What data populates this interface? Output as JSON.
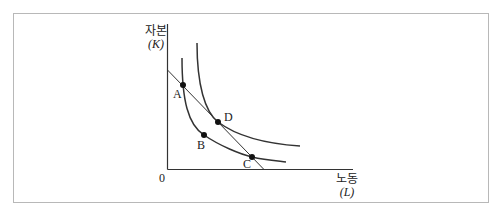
{
  "diagram": {
    "y_axis": {
      "title": "자본",
      "symbol": "(K)"
    },
    "x_axis": {
      "title": "노동",
      "symbol": "(L)"
    },
    "origin_label": "0",
    "points": [
      {
        "label": "A",
        "x": 183,
        "y": 85
      },
      {
        "label": "B",
        "x": 204,
        "y": 135
      },
      {
        "label": "C",
        "x": 252,
        "y": 157
      },
      {
        "label": "D",
        "x": 218,
        "y": 122
      }
    ],
    "curves": [
      {
        "name": "inner-isoquant",
        "passes_through": [
          "A",
          "B",
          "C"
        ]
      },
      {
        "name": "outer-isoquant",
        "passes_through": [
          "D"
        ]
      }
    ],
    "lines": [
      {
        "name": "isocost-line",
        "passes_through": [
          "A",
          "D",
          "C"
        ]
      }
    ]
  }
}
